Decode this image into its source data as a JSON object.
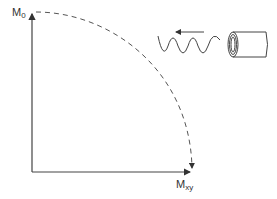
{
  "diagram": {
    "y_axis_label": "M",
    "y_axis_sub": "0",
    "x_axis_label": "M",
    "x_axis_sub": "xy",
    "elements": [
      "vertical-axis-arrow",
      "horizontal-axis-arrow",
      "dashed-arc-arrow",
      "sine-wave",
      "direction-arrow-left",
      "rf-coil"
    ],
    "colors": {
      "line": "#444444",
      "dashed": "#555555"
    }
  }
}
